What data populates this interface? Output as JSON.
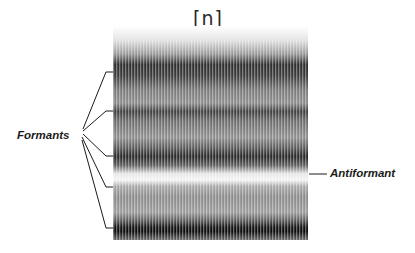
{
  "figure": {
    "title": "[n]",
    "type": "spectrogram",
    "labels": {
      "formants": "Formants",
      "antiformant": "Antiformant"
    },
    "formant_band_y": [
      72,
      111,
      156,
      187,
      228
    ],
    "antiformant_band_y": 174,
    "colors": {
      "background": "#ffffff",
      "ink": "#1a1a1a",
      "band_dark": "#1e1e1e",
      "band_light": "#f2f2f2"
    }
  }
}
